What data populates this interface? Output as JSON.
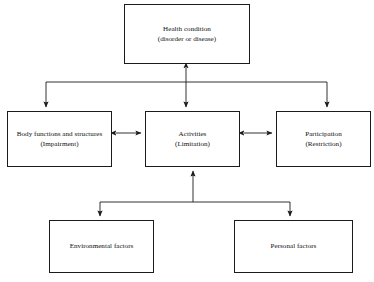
{
  "diagram": {
    "type": "flow-diagram",
    "background_color": "#ffffff",
    "line_color": "#1b1b1b",
    "text_color": "#101010",
    "nodes": [
      {
        "id": "health-condition",
        "line1": "Health condition",
        "line2": "(disorder or disease)",
        "x": 124,
        "y": 4,
        "w": 126,
        "h": 60
      },
      {
        "id": "body-functions",
        "line1": "Body functions and structures",
        "line2": "(Impairment)",
        "x": 7,
        "y": 111,
        "w": 105,
        "h": 56
      },
      {
        "id": "activities",
        "line1": "Activities",
        "line2": "(Limitation)",
        "x": 145,
        "y": 111,
        "w": 95,
        "h": 56
      },
      {
        "id": "participation",
        "line1": "Participation",
        "line2": "(Restriction)",
        "x": 276,
        "y": 111,
        "w": 95,
        "h": 56
      },
      {
        "id": "environmental-factors",
        "line1": "Environmental factors",
        "line2": "",
        "x": 49,
        "y": 220,
        "w": 105,
        "h": 53
      },
      {
        "id": "personal-factors",
        "line1": "Personal factors",
        "line2": "",
        "x": 234,
        "y": 220,
        "w": 119,
        "h": 53
      }
    ],
    "connectors": [
      {
        "id": "health-to-activities",
        "style": "double-headed-vertical"
      },
      {
        "id": "upper-bus-to-body-functions",
        "style": "single-arrow-down"
      },
      {
        "id": "upper-bus-to-participation",
        "style": "single-arrow-down"
      },
      {
        "id": "body-functions-to-activities",
        "style": "double-headed-horizontal"
      },
      {
        "id": "activities-to-participation",
        "style": "double-headed-horizontal"
      },
      {
        "id": "lower-bus-to-activities",
        "style": "single-arrow-up"
      },
      {
        "id": "lower-bus-to-environmental-factors",
        "style": "single-arrow-down"
      },
      {
        "id": "lower-bus-to-personal-factors",
        "style": "single-arrow-down"
      }
    ]
  }
}
